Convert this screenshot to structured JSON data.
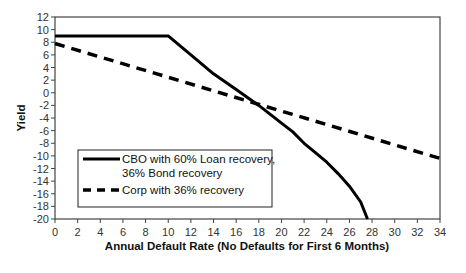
{
  "chart_data": {
    "type": "line",
    "title": "",
    "xlabel": "Annual Default Rate (No Defaults for First 6 Months)",
    "ylabel": "Yield",
    "xlim": [
      0,
      34
    ],
    "ylim": [
      -20,
      12
    ],
    "x_ticks": [
      0,
      2,
      4,
      6,
      8,
      10,
      12,
      14,
      16,
      18,
      20,
      22,
      24,
      26,
      28,
      30,
      32,
      34
    ],
    "y_ticks": [
      12,
      10,
      8,
      6,
      4,
      2,
      0,
      -2,
      -4,
      -6,
      -8,
      -10,
      -12,
      -14,
      -16,
      -18,
      -20
    ],
    "grid": false,
    "legend_position": "lower-left inside",
    "series": [
      {
        "name": "CBO with 60% Loan recovery, 36% Bond recovery",
        "legend_lines": [
          "CBO with 60% Loan recovery,",
          "36% Bond recovery"
        ],
        "style": "solid",
        "color": "#000000",
        "x": [
          0,
          10,
          12,
          14,
          16,
          18,
          20,
          21,
          22,
          23,
          24,
          25,
          26,
          27,
          27.6
        ],
        "y": [
          9,
          9,
          6,
          3,
          0.5,
          -2,
          -4.8,
          -6.2,
          -8,
          -9.5,
          -11,
          -12.8,
          -14.8,
          -17.3,
          -20
        ]
      },
      {
        "name": "Corp with 36% recovery",
        "legend_lines": [
          "Corp with 36% recovery"
        ],
        "style": "dashed",
        "color": "#000000",
        "x": [
          0,
          34
        ],
        "y": [
          7.8,
          -10.4
        ]
      }
    ]
  }
}
